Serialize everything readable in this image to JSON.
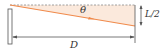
{
  "diagram": {
    "labels": {
      "angle": "θ",
      "half_length": "L/2",
      "distance": "D"
    },
    "colors": {
      "beam": "#f08a4b",
      "shade": "#fbe9dc",
      "line": "#555555",
      "dashed": "#888888",
      "mirror_fill": "#ffffff"
    }
  }
}
